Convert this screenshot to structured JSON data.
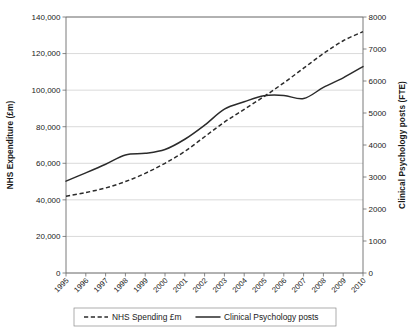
{
  "chart_data": {
    "type": "line",
    "title": "",
    "xlabel": "",
    "x": [
      "1995",
      "1996",
      "1997",
      "1998",
      "1999",
      "2000",
      "2001",
      "2002",
      "2003",
      "2004",
      "2005",
      "2006",
      "2007",
      "2008",
      "2009",
      "2010"
    ],
    "grid": true,
    "legend_position": "bottom",
    "axes": {
      "left": {
        "label": "NHS Expenditure (£m)",
        "ylim": [
          0,
          140000
        ],
        "ticks": [
          0,
          20000,
          40000,
          60000,
          80000,
          100000,
          120000,
          140000
        ],
        "tick_labels": [
          "0",
          "20,000",
          "40,000",
          "60,000",
          "80,000",
          "100,000",
          "120,000",
          "140,000"
        ]
      },
      "right": {
        "label": "Clinical Psychology posts (FTE)",
        "ylim": [
          0,
          8000
        ],
        "ticks": [
          0,
          1000,
          2000,
          3000,
          4000,
          5000,
          6000,
          7000,
          8000
        ],
        "tick_labels": [
          "0",
          "1000",
          "2000",
          "3000",
          "4000",
          "5000",
          "6000",
          "7000",
          "8000"
        ]
      }
    },
    "series": [
      {
        "name": "NHS Spending £m",
        "axis": "left",
        "style": "dashed",
        "color": "#2b2b2b",
        "values": [
          42000,
          44000,
          46500,
          50000,
          54500,
          60000,
          66500,
          74500,
          82500,
          89500,
          96500,
          104000,
          112000,
          120000,
          127000,
          132000
        ]
      },
      {
        "name": "Clinical Psychology posts",
        "axis": "right",
        "style": "solid",
        "color": "#2b2b2b",
        "values": [
          2870,
          3130,
          3400,
          3690,
          3740,
          3860,
          4180,
          4620,
          5120,
          5350,
          5540,
          5550,
          5450,
          5800,
          6100,
          6450
        ]
      }
    ],
    "legend": [
      {
        "label": "NHS Spending £m",
        "style": "dashed"
      },
      {
        "label": "Clinical Psychology posts",
        "style": "solid"
      }
    ]
  }
}
